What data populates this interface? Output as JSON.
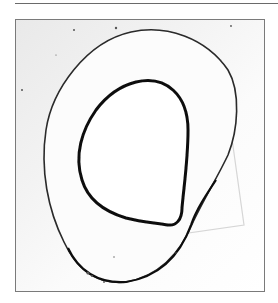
{
  "image": {
    "description": "Grayscale micrograph of a ring-shaped cross section with thick dark inner contour and thin outer contour inside a bordered frame",
    "colors": {
      "inner_contour": "#111111",
      "outer_contour": "#2a2a2a",
      "frame_border": "#7a7a7a",
      "top_rule": "#6a6a6a"
    }
  }
}
